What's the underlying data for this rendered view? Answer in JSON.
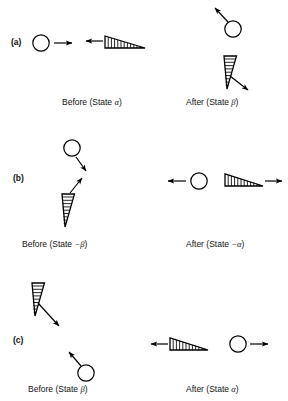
{
  "figure": {
    "type": "physics-diagram",
    "stroke_color": "#000000",
    "background_color": "#ffffff"
  },
  "panels": [
    {
      "id": "a",
      "label": "(a)",
      "before": {
        "caption_prefix": "Before (State ",
        "caption_symbol": "α",
        "caption_suffix": ")",
        "caption_full": "Before (State α)",
        "objects": [
          {
            "kind": "ball",
            "arrow_direction": "right"
          },
          {
            "kind": "wedge",
            "arrow_direction": "left",
            "orientation": "upright"
          }
        ]
      },
      "after": {
        "caption_prefix": "After (State ",
        "caption_symbol": "β",
        "caption_suffix": ")",
        "caption_full": "After (State β)",
        "objects": [
          {
            "kind": "ball",
            "arrow_direction": "up-left"
          },
          {
            "kind": "wedge",
            "arrow_direction": "down-right",
            "orientation": "rotated"
          }
        ]
      }
    },
    {
      "id": "b",
      "label": "(b)",
      "before": {
        "caption_prefix": "Before (State ",
        "caption_symbol": "−β",
        "caption_suffix": ")",
        "caption_full": "Before (State −β)",
        "objects": [
          {
            "kind": "ball",
            "arrow_direction": "down-right"
          },
          {
            "kind": "wedge",
            "arrow_direction": "up-left",
            "orientation": "rotated"
          }
        ]
      },
      "after": {
        "caption_prefix": "After (State ",
        "caption_symbol": "−α",
        "caption_suffix": ")",
        "caption_full": "After (State −α)",
        "objects": [
          {
            "kind": "ball",
            "arrow_direction": "left"
          },
          {
            "kind": "wedge",
            "arrow_direction": "right",
            "orientation": "upright"
          }
        ]
      }
    },
    {
      "id": "c",
      "label": "(c)",
      "before": {
        "caption_prefix": "Before (State ",
        "caption_symbol": "β",
        "caption_suffix": ")",
        "caption_full": "Before (State β)",
        "objects": [
          {
            "kind": "wedge",
            "arrow_direction": "down-right",
            "orientation": "rotated"
          },
          {
            "kind": "ball",
            "arrow_direction": "up-left"
          }
        ]
      },
      "after": {
        "caption_prefix": "After (State ",
        "caption_symbol": "α",
        "caption_suffix": ")",
        "caption_full": "After (State α)",
        "objects": [
          {
            "kind": "wedge",
            "arrow_direction": "left",
            "orientation": "upright"
          },
          {
            "kind": "ball",
            "arrow_direction": "right"
          }
        ]
      }
    }
  ]
}
